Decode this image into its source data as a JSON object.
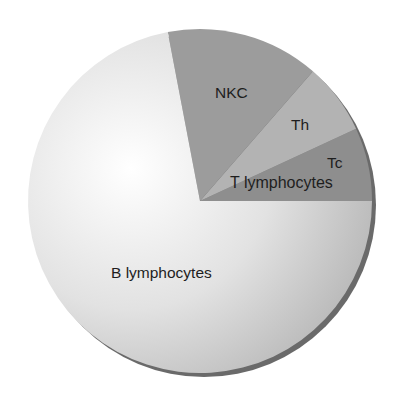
{
  "chart_data": {
    "type": "pie",
    "title": "",
    "categories": [
      "B lymphocytes",
      "NKC",
      "Th",
      "Tc"
    ],
    "values": [
      72,
      14.4,
      6.7,
      6.9
    ],
    "unit": "%",
    "group_labels": {
      "T lymphocytes": [
        "Th",
        "Tc"
      ]
    },
    "start_angle_deg": 0,
    "direction": "counterclockwise-from-east",
    "legend": "none (labels on slices)",
    "colors": {
      "B lymphocytes": "#d9d9d9",
      "NKC": "#9c9c9c",
      "Th": "#b3b3b3",
      "Tc": "#8e8e8e"
    }
  },
  "labels": {
    "nkc": "NKC",
    "th": "Th",
    "tc": "Tc",
    "t_lymphocytes": "T lymphocytes",
    "b_lymphocytes": "B lymphocytes"
  }
}
